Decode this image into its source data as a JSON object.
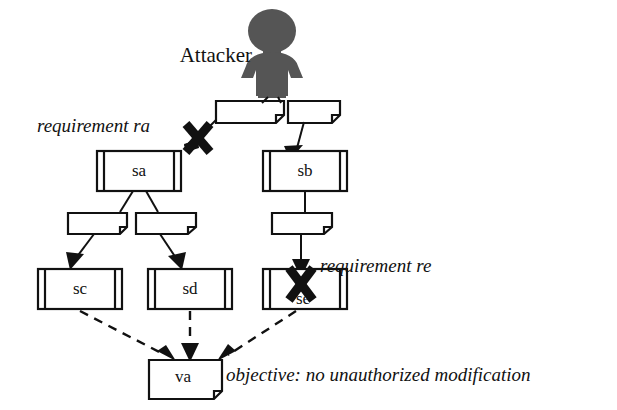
{
  "diagram": {
    "actor": {
      "label": "Attacker",
      "icon": "attacker-person-icon",
      "color": "#555555"
    },
    "nodes": [
      {
        "id": "sa",
        "label": "sa",
        "type": "component"
      },
      {
        "id": "sb",
        "label": "sb",
        "type": "component"
      },
      {
        "id": "sc",
        "label": "sc",
        "type": "component"
      },
      {
        "id": "sd",
        "label": "sd",
        "type": "component"
      },
      {
        "id": "se",
        "label": "se",
        "type": "component"
      },
      {
        "id": "va",
        "label": "va",
        "type": "note"
      }
    ],
    "connectors": [
      {
        "id": "n1",
        "label": "",
        "type": "note"
      },
      {
        "id": "n2",
        "label": "",
        "type": "note"
      },
      {
        "id": "n3",
        "label": "",
        "type": "note"
      },
      {
        "id": "n4",
        "label": "",
        "type": "note"
      },
      {
        "id": "n5",
        "label": "",
        "type": "note"
      }
    ],
    "annotations": [
      {
        "id": "ra",
        "text": "requirement ra"
      },
      {
        "id": "re",
        "text": "requirement re"
      },
      {
        "id": "objective",
        "text": "objective: no unauthorized modification"
      }
    ],
    "blocked_markers": [
      {
        "id": "x-ra",
        "name": "blocked-x-marker-ra"
      },
      {
        "id": "x-re",
        "name": "blocked-x-marker-re"
      }
    ],
    "colors": {
      "line": "#111111",
      "actor": "#555555",
      "background": "#ffffff"
    }
  }
}
